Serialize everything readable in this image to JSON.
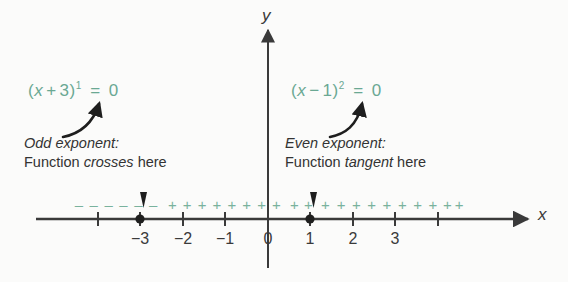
{
  "figure": {
    "background_color": "#fbfbfa",
    "accent_color": "#6aa893",
    "sign_mark_color": "#79b29d",
    "ink_color": "#333333"
  },
  "equations": {
    "left": {
      "open_paren": "(",
      "variable": "x",
      "operator": "+",
      "constant": "3",
      "close_paren": ")",
      "exponent": "1",
      "equals": "=",
      "value": "0",
      "plain": "(x + 3)¹ = 0"
    },
    "right": {
      "open_paren": "(",
      "variable": "x",
      "operator": "−",
      "constant": "1",
      "close_paren": ")",
      "exponent": "2",
      "equals": "=",
      "value": "0",
      "plain": "(x − 1)² = 0"
    }
  },
  "annotations": {
    "left": {
      "heading": "Odd exponent:",
      "body_prefix": "Function ",
      "body_emphasis": "crosses",
      "body_suffix": " here"
    },
    "right": {
      "heading": "Even exponent:",
      "body_prefix": "Function ",
      "body_emphasis": "tangent",
      "body_suffix": " here"
    }
  },
  "axes": {
    "x_label": "x",
    "y_label": "y",
    "x_tick_labels": [
      "−3",
      "−2",
      "−1",
      "0",
      "1",
      "2",
      "3"
    ]
  },
  "chart_data": {
    "type": "line",
    "xlabel": "x",
    "ylabel": "y",
    "xlim": [
      -4.6,
      4.6
    ],
    "ylim": [
      -1,
      1
    ],
    "grid": false,
    "legend": null,
    "x_ticks": [
      -4,
      -3,
      -2,
      -1,
      0,
      1,
      2,
      3,
      4
    ],
    "x_tick_labels": [
      "",
      "−3",
      "−2",
      "−1",
      "0",
      "1",
      "2",
      "3",
      ""
    ],
    "zeros": [
      {
        "x": -3,
        "factor": "(x + 3)",
        "exponent": 1,
        "exponent_parity": "odd",
        "behavior": "crosses",
        "marker": "filled-dot",
        "pointer": "down-arrow"
      },
      {
        "x": 1,
        "factor": "(x − 1)",
        "exponent": 2,
        "exponent_parity": "even",
        "behavior": "tangent",
        "marker": "filled-dot",
        "pointer": "down-arrow"
      }
    ],
    "sign_intervals": [
      {
        "from": -4.6,
        "to": -3,
        "sign": "−",
        "symbol": "–",
        "count": 6
      },
      {
        "from": -3,
        "to": 1,
        "sign": "+",
        "symbol": "+",
        "count": 11
      },
      {
        "from": 1,
        "to": 4.6,
        "sign": "+",
        "symbol": "+",
        "count": 13
      }
    ]
  },
  "sign_marks": {
    "minus_symbol": "–",
    "plus_symbol": "+",
    "minus_positions": [
      -4.45,
      -4.1,
      -3.75,
      -3.4,
      -3.05,
      -2.7
    ],
    "plus_positions": [
      -2.25,
      -1.9,
      -1.55,
      -1.2,
      -0.85,
      -0.5,
      -0.15,
      0.2,
      0.62,
      0.95,
      1.35,
      1.72,
      2.08,
      2.44,
      2.8,
      3.16,
      3.52,
      3.88,
      4.22,
      4.5
    ]
  }
}
